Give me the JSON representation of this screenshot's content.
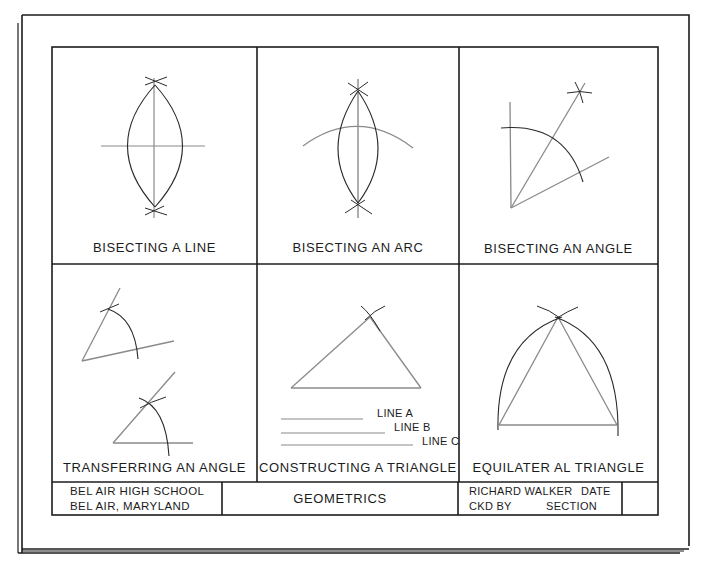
{
  "sheet": {
    "title": "GEOMETRICS",
    "colors": {
      "ink": "#1c1c1c",
      "construction": "#8a8a8a",
      "paper": "#ffffff"
    }
  },
  "panels": [
    {
      "id": "bisecting-line",
      "label": "BISECTING A LINE"
    },
    {
      "id": "bisecting-arc",
      "label": "BISECTING AN ARC"
    },
    {
      "id": "bisecting-angle",
      "label": "BISECTING AN ANGLE"
    },
    {
      "id": "transferring-angle",
      "label": "TRANSFERRING AN ANGLE"
    },
    {
      "id": "constructing-triangle",
      "label": "CONSTRUCTING A TRIANGLE",
      "lines": [
        "LINE A",
        "LINE B",
        "LINE C"
      ]
    },
    {
      "id": "equilateral-triangle",
      "label": "EQUILATER AL TRIANGLE"
    }
  ],
  "title_block": {
    "school_line1": "BEL AIR HIGH SCHOOL",
    "school_line2": "BEL AIR, MARYLAND",
    "drawing_title": "GEOMETRICS",
    "drawn_by": "RICHARD WALKER",
    "date_label": "DATE",
    "checked_by_label": "CKD BY",
    "section_label": "SECTION",
    "section_value": ""
  }
}
